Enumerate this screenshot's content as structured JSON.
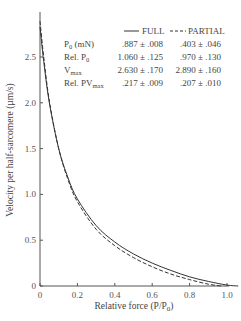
{
  "chart_data": {
    "type": "line",
    "title": "",
    "xlabel": "Relative force (P/P0)",
    "ylabel": "Velocity per half-sarcomere (µm/s)",
    "xlim": [
      0,
      1.05
    ],
    "ylim": [
      0,
      2.9
    ],
    "x_ticks": [
      "0",
      "0.2",
      "0.4",
      "0.6",
      "0.8",
      "1.0"
    ],
    "y_ticks": [
      "0",
      "0.5",
      "1.0",
      "1.5",
      "2.0",
      "2.5"
    ],
    "grid": false,
    "legend_position": "top-right",
    "series": [
      {
        "name": "FULL",
        "style": "solid",
        "x": [
          0.0,
          0.02,
          0.05,
          0.1,
          0.15,
          0.2,
          0.3,
          0.4,
          0.5,
          0.6,
          0.7,
          0.8,
          0.9,
          1.0,
          1.06
        ],
        "values": [
          2.83,
          2.45,
          2.0,
          1.5,
          1.18,
          0.95,
          0.66,
          0.48,
          0.35,
          0.25,
          0.17,
          0.1,
          0.05,
          0.01,
          0.0
        ]
      },
      {
        "name": "PARTIAL",
        "style": "dashed",
        "x": [
          0.0,
          0.02,
          0.05,
          0.1,
          0.15,
          0.2,
          0.3,
          0.4,
          0.5,
          0.6,
          0.7,
          0.8,
          0.9,
          0.97
        ],
        "values": [
          2.89,
          2.5,
          2.02,
          1.5,
          1.16,
          0.92,
          0.62,
          0.44,
          0.31,
          0.21,
          0.13,
          0.07,
          0.02,
          0.0
        ]
      }
    ],
    "table": {
      "legend": [
        {
          "label": "FULL",
          "style": "solid"
        },
        {
          "label": "PARTIAL",
          "style": "dashed"
        }
      ],
      "rows": [
        {
          "param": "P",
          "sub": "0",
          "suffix": " (mN)",
          "full": ".887 ± .008",
          "partial": ".403 ± .046"
        },
        {
          "param": "Rel. P",
          "sub": "0",
          "suffix": "",
          "full": "1.060 ± .125",
          "partial": ".970 ± .130"
        },
        {
          "param": "V",
          "sub": "max",
          "suffix": "",
          "full": "2.630 ± .170",
          "partial": "2.890 ± .160"
        },
        {
          "param": "Rel. PV",
          "sub": "max",
          "suffix": "",
          "full": ".217 ± .009",
          "partial": ".207 ± .010"
        }
      ]
    }
  }
}
